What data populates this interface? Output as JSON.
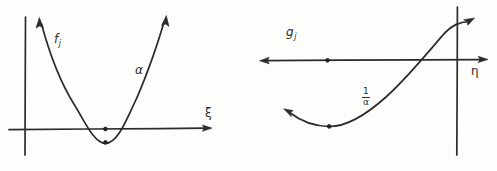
{
  "figure": {
    "background_color": "#fdfdfc",
    "ink_color": "#2b2b2b",
    "panels": [
      {
        "id": "left-panel",
        "description": "upward-opening parabola crossing the horizontal axis, hand drawn",
        "axis_horizontal_label": "ξ",
        "axis_vertical_label": "",
        "curve_label": "f",
        "curve_label_subscript": "j",
        "curve_parameter_label": "α",
        "marked_points": 2
      },
      {
        "id": "right-panel",
        "description": "upward curve rising through the vertical axis, hand drawn",
        "axis_horizontal_label": "η",
        "axis_vertical_label": "",
        "curve_label": "g",
        "curve_label_subscript": "j",
        "curve_parameter_numerator": "1",
        "curve_parameter_denominator": "α",
        "marked_points": 2
      }
    ]
  },
  "labels": {
    "left_f": "f",
    "left_f_sub": "j",
    "left_alpha": "α",
    "left_xi": "ξ",
    "right_g": "g",
    "right_g_sub": "j",
    "right_frac_num": "1",
    "right_frac_den": "α",
    "right_eta": "η"
  }
}
